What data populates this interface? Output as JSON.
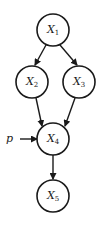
{
  "diagram": {
    "type": "directed-acyclic-graph",
    "nodes": [
      {
        "id": "X1",
        "base": "X",
        "sub": "1",
        "cx": 53,
        "cy": 30
      },
      {
        "id": "X2",
        "base": "X",
        "sub": "2",
        "cx": 32,
        "cy": 82
      },
      {
        "id": "X3",
        "base": "X",
        "sub": "3",
        "cx": 79,
        "cy": 82
      },
      {
        "id": "X4",
        "base": "X",
        "sub": "4",
        "cx": 53,
        "cy": 139
      },
      {
        "id": "X5",
        "base": "X",
        "sub": "5",
        "cx": 53,
        "cy": 196
      }
    ],
    "edges": [
      {
        "from": "X1",
        "to": "X2"
      },
      {
        "from": "X1",
        "to": "X3"
      },
      {
        "from": "X2",
        "to": "X4"
      },
      {
        "from": "X3",
        "to": "X4"
      },
      {
        "from": "p",
        "to": "X4"
      },
      {
        "from": "X4",
        "to": "X5"
      }
    ],
    "external_input": {
      "label": "p"
    }
  }
}
